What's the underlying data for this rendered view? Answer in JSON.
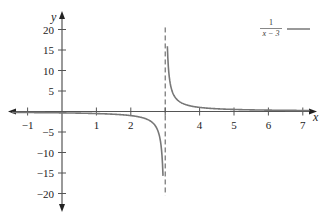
{
  "chart_data": {
    "type": "line",
    "title": "",
    "function": "1/(x - 3)",
    "xlabel": "x",
    "ylabel": "y",
    "xlim": [
      -1,
      7
    ],
    "ylim": [
      -20,
      20
    ],
    "grid": false,
    "legend_position": "top-right",
    "x_ticks": [
      -1,
      1,
      2,
      4,
      5,
      6,
      7
    ],
    "x_tick_labels": [
      "−1",
      "1",
      "2",
      "4",
      "5",
      "6",
      "7"
    ],
    "y_ticks": [
      20,
      15,
      10,
      5,
      -5,
      -10,
      -15,
      -20
    ],
    "y_tick_labels": [
      "20",
      "15",
      "10",
      "5",
      "−5",
      "−10",
      "−15",
      "−20"
    ],
    "asymptote": {
      "type": "vertical",
      "x": 3,
      "style": "dashed"
    },
    "series": [
      {
        "name": "1/(x − 3)",
        "color": "#777777",
        "branches": [
          {
            "x": [
              -1,
              0,
              1,
              2,
              2.5,
              2.8,
              2.9,
              2.95
            ],
            "y": [
              -0.25,
              -0.333,
              -0.5,
              -1,
              -2,
              -5,
              -10,
              -20
            ]
          },
          {
            "x": [
              3.05,
              3.1,
              3.2,
              3.5,
              4,
              5,
              6,
              7
            ],
            "y": [
              20,
              10,
              5,
              2,
              1,
              0.5,
              0.333,
              0.25
            ]
          }
        ]
      }
    ]
  },
  "legend": {
    "numerator": "1",
    "denominator": "x − 3"
  },
  "axes": {
    "x_label": "x",
    "y_label": "y",
    "x_tick_labels": [
      "−1",
      "1",
      "2",
      "4",
      "5",
      "6",
      "7"
    ],
    "y_tick_labels": [
      "20",
      "15",
      "10",
      "5",
      "−5",
      "−10",
      "−15",
      "−20"
    ]
  },
  "colors": {
    "axis": "#555555",
    "curve": "#777777",
    "asymptote": "#555555",
    "text": "#222222"
  }
}
